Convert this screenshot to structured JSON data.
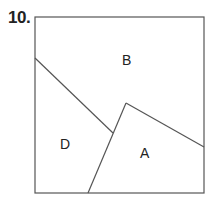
{
  "problem_number": "10.",
  "figure": {
    "square": {
      "x": 35,
      "y": 17,
      "width": 169,
      "height": 176
    },
    "stroke_color": "#555555",
    "lines": [
      {
        "name": "divider-b-d",
        "x1": 35,
        "y1": 58,
        "x2": 113,
        "y2": 133
      },
      {
        "name": "divider-a-left",
        "x1": 126,
        "y1": 103,
        "x2": 88,
        "y2": 193
      },
      {
        "name": "divider-a-top",
        "x1": 126,
        "y1": 103,
        "x2": 204,
        "y2": 147
      }
    ],
    "regions": [
      {
        "label": "B",
        "x": 122,
        "y": 50
      },
      {
        "label": "D",
        "x": 60,
        "y": 136
      },
      {
        "label": "A",
        "x": 140,
        "y": 145
      }
    ]
  }
}
